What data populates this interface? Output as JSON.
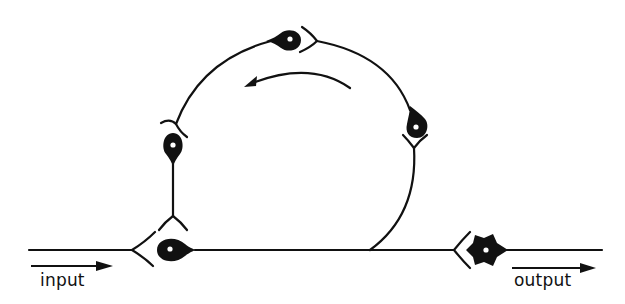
{
  "diagram": {
    "type": "neural-circuit",
    "labels": {
      "input": "input",
      "output": "output"
    },
    "colors": {
      "ink": "#111111",
      "background": "#ffffff",
      "nucleus": "#ffffff"
    },
    "nodes": [
      {
        "id": "input-neuron",
        "shape": "teardrop",
        "position": "bottom-left"
      },
      {
        "id": "left-loop-neuron",
        "shape": "teardrop",
        "position": "left"
      },
      {
        "id": "top-loop-neuron",
        "shape": "teardrop",
        "position": "top"
      },
      {
        "id": "right-loop-neuron",
        "shape": "teardrop",
        "position": "right"
      },
      {
        "id": "output-neuron",
        "shape": "star",
        "position": "bottom-right"
      }
    ],
    "flow_direction": "counter-clockwise"
  }
}
